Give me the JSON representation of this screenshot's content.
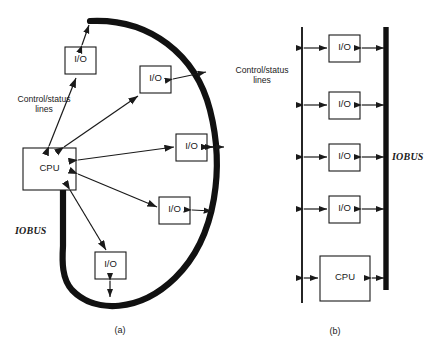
{
  "figure": {
    "title_absent": true,
    "background_color": "#ffffff",
    "stroke_color": "#1a1a1a",
    "bus_color": "#111111"
  },
  "panel_a": {
    "caption": "(a)",
    "bus_label": "IOBUS",
    "control_label_line1": "Control/status",
    "control_label_line2": "lines",
    "cpu_label": "CPU",
    "io_boxes": [
      {
        "label": "I/O",
        "position": "top"
      },
      {
        "label": "I/O",
        "position": "upper-right"
      },
      {
        "label": "I/O",
        "position": "middle-right"
      },
      {
        "label": "I/O",
        "position": "lower-right"
      },
      {
        "label": "I/O",
        "position": "bottom"
      }
    ]
  },
  "panel_b": {
    "caption": "(b)",
    "bus_label": "IOBUS",
    "control_label_line1": "Control/status",
    "control_label_line2": "lines",
    "cpu_label": "CPU",
    "io_boxes": [
      {
        "label": "I/O",
        "position": "row-1"
      },
      {
        "label": "I/O",
        "position": "row-2"
      },
      {
        "label": "I/O",
        "position": "row-3"
      },
      {
        "label": "I/O",
        "position": "row-4"
      }
    ]
  }
}
